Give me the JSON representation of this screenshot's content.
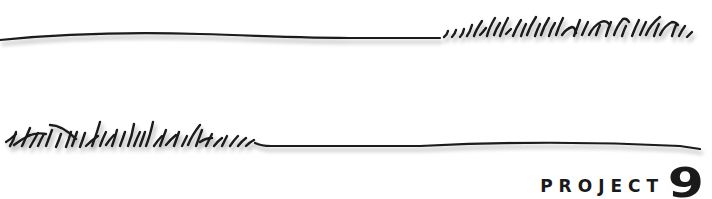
{
  "header": {
    "label": "PROJECT",
    "number": "9"
  },
  "decorations": {
    "top_rule": "grass-line-right",
    "bottom_rule": "grass-line-left"
  },
  "colors": {
    "ink": "#1a1a1a",
    "shadow": "#b5b5b5",
    "background": "#ffffff"
  }
}
